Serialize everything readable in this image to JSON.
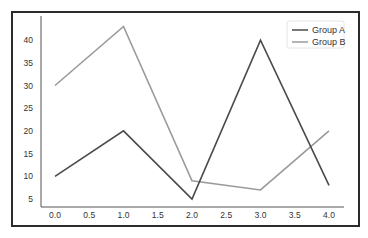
{
  "chart_data": {
    "type": "line",
    "title": "",
    "xlabel": "",
    "ylabel": "",
    "x": [
      0,
      1,
      2,
      3,
      4
    ],
    "series": [
      {
        "name": "Group A",
        "values": [
          10,
          20,
          5,
          40,
          8
        ],
        "color": "#4a4a4a"
      },
      {
        "name": "Group B",
        "values": [
          30,
          43,
          9,
          7,
          20
        ],
        "color": "#9a9a9a"
      }
    ],
    "xticks": [
      "0.0",
      "0.5",
      "1.0",
      "1.5",
      "2.0",
      "2.5",
      "3.0",
      "3.5",
      "4.0"
    ],
    "yticks": [
      "5",
      "10",
      "15",
      "20",
      "25",
      "30",
      "35",
      "40"
    ],
    "xlim": [
      -0.2,
      4.2
    ],
    "ylim": [
      3.2,
      45
    ],
    "grid": false,
    "legend_position": "upper right"
  },
  "legend": {
    "items": [
      {
        "label": "Group A",
        "color": "#4a4a4a"
      },
      {
        "label": "Group B",
        "color": "#9a9a9a"
      }
    ]
  }
}
